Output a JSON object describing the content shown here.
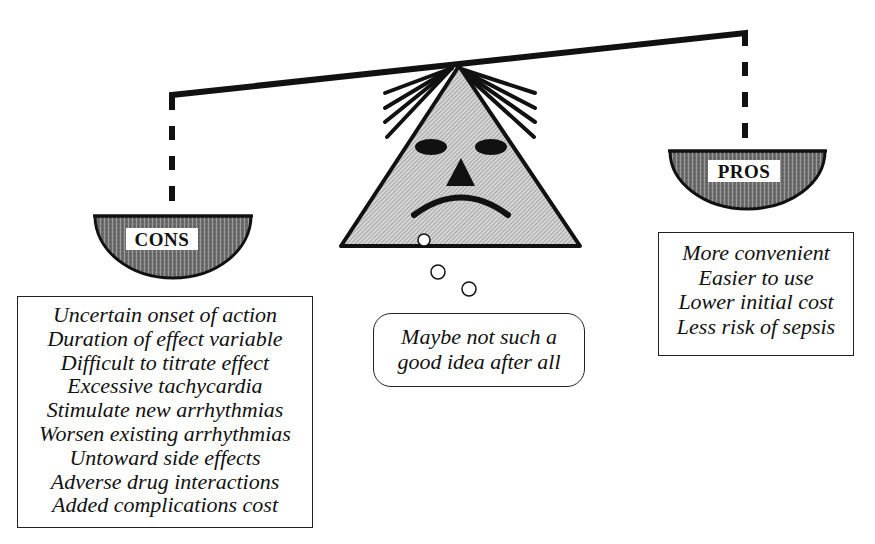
{
  "diagram": {
    "type": "balance-scale-cartoon",
    "beam": {
      "description": "tilted beam pivoting on top of triangular face; left (CONS) side lower, right (PROS) side higher"
    },
    "face": {
      "expression": "frowning",
      "features": [
        "hair-strands",
        "two-oval-eyes",
        "triangle-nose",
        "frown-mouth"
      ]
    },
    "cons": {
      "label": "CONS",
      "items": [
        "Uncertain onset of action",
        "Duration of effect variable",
        "Difficult to titrate effect",
        "Excessive tachycardia",
        "Stimulate new arrhythmias",
        "Worsen existing arrhythmias",
        "Untoward side effects",
        "Adverse drug interactions",
        "Added complications cost"
      ]
    },
    "pros": {
      "label": "PROS",
      "items": [
        "More convenient",
        "Easier to use",
        "Lower initial cost",
        "Less risk of sepsis"
      ]
    },
    "thought": {
      "lines": [
        "Maybe not such a",
        "good idea after all"
      ]
    },
    "colors": {
      "ink": "#111111",
      "face_fill": "#c8c8c8",
      "pan_fill": "#7a7a7a",
      "background": "#ffffff"
    }
  }
}
